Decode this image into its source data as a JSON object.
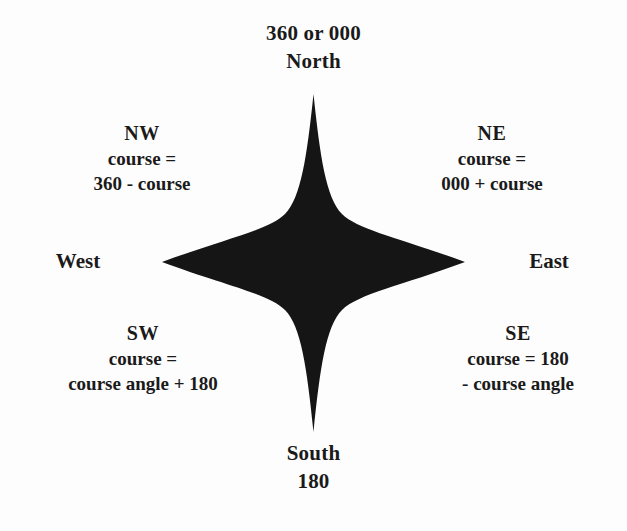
{
  "figure": {
    "background_color": "#fdfdfd",
    "ink_color": "#1a1a1a"
  },
  "cardinals": {
    "north": {
      "degrees": "360 or 000",
      "name": "North"
    },
    "south": {
      "name": "South",
      "degrees": "180"
    },
    "west": {
      "name": "West"
    },
    "east": {
      "name": "East"
    }
  },
  "quadrants": {
    "nw": {
      "abbr": "NW",
      "line1": "course =",
      "line2": "360 - course"
    },
    "ne": {
      "abbr": "NE",
      "line1": "course =",
      "line2": "000 + course"
    },
    "sw": {
      "abbr": "SW",
      "line1": "course =",
      "line2": "course angle + 180"
    },
    "se": {
      "abbr": "SE",
      "line1": "course = 180",
      "line2": "- course angle"
    }
  },
  "star": {
    "fill_color": "#151515",
    "points": 4
  }
}
